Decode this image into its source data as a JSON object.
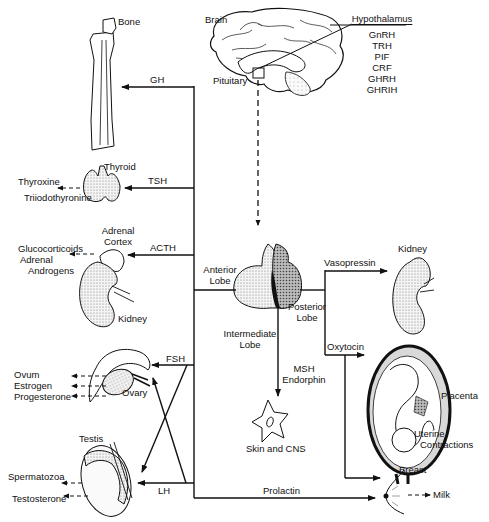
{
  "brain": {
    "label": "Brain",
    "pituitary_label": "Pituitary"
  },
  "hypothalamus": {
    "title": "Hypothalamus",
    "hormones": [
      "GnRH",
      "TRH",
      "PIF",
      "CRF",
      "GHRH",
      "GHRIH"
    ]
  },
  "pituitary": {
    "anterior_lobe": [
      "Anterior",
      "Lobe"
    ],
    "posterior_lobe": [
      "Posterior",
      "Lobe"
    ],
    "intermediate_lobe": [
      "Intermediate",
      "Lobe"
    ]
  },
  "anterior_hormones": {
    "gh": "GH",
    "tsh": "TSH",
    "acth": "ACTH",
    "fsh": "FSH",
    "lh": "LH",
    "prolactin": "Prolactin"
  },
  "posterior_hormones": {
    "vasopressin": "Vasopressin",
    "oxytocin": "Oxytocin"
  },
  "intermediate_hormones": [
    "MSH",
    "Endorphin"
  ],
  "targets": {
    "bone": "Bone",
    "thyroid": "Thyroid",
    "adrenal_cortex": [
      "Adrenal",
      "Cortex"
    ],
    "kidney_left": "Kidney",
    "ovary": "Ovary",
    "testis": "Testis",
    "kidney_right": "Kidney",
    "placenta": "Placenta",
    "uterine": [
      "Uterine",
      "Contractions"
    ],
    "skin_cns": "Skin and CNS",
    "breast": "Breast"
  },
  "outputs": {
    "thyroid": [
      "Thyroxine",
      "Triiodothyronine"
    ],
    "adrenal": [
      "Glucocorticoids",
      "Adrenal",
      "Androgens"
    ],
    "ovary": [
      "Ovum",
      "Estrogen",
      "Progesterone"
    ],
    "testis": [
      "Spermatozoa",
      "Testosterone"
    ],
    "breast": "Milk"
  }
}
